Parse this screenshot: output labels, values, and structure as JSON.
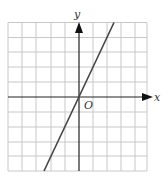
{
  "graph": {
    "x_label": "x",
    "y_label": "y",
    "origin_label": "O",
    "grid": {
      "columns": 10,
      "rows": 10
    },
    "line": {
      "equation": "y = 2x",
      "slope": 2,
      "intercept": 0
    },
    "colors": {
      "grid": "#c8c8c8",
      "axis": "#222222",
      "line": "#444444"
    }
  }
}
